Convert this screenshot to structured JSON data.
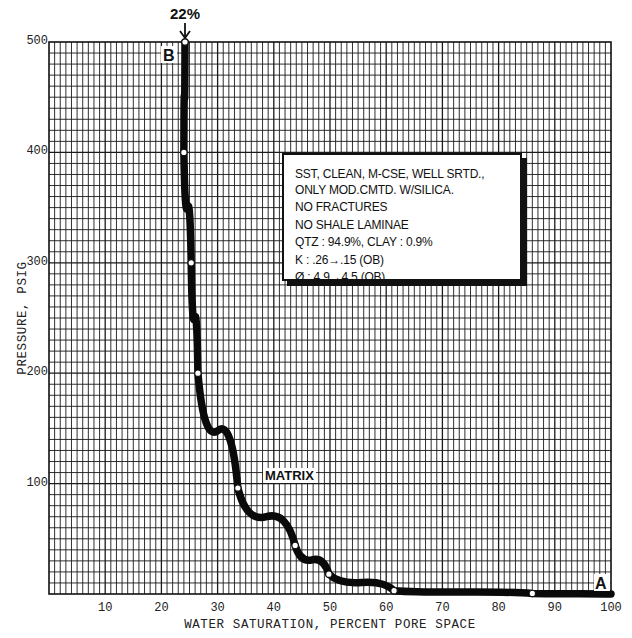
{
  "chart_data": {
    "type": "line",
    "title": "",
    "xlabel": "WATER SATURATION, PERCENT PORE SPACE",
    "ylabel": "PRESSURE, PSIG",
    "xlim": [
      0,
      100
    ],
    "ylim": [
      0,
      500
    ],
    "x_ticks": [
      10,
      20,
      30,
      40,
      50,
      60,
      70,
      80,
      90,
      100
    ],
    "y_ticks": [
      100,
      200,
      300,
      400,
      500
    ],
    "grid": true,
    "series": [
      {
        "name": "MATRIX",
        "x": [
          24.2,
          24.0,
          25.3,
          26.5,
          33.6,
          43.8,
          49.8,
          61.4,
          86.0,
          100
        ],
        "y": [
          500,
          400,
          300,
          200,
          96,
          44,
          18,
          3,
          0.5,
          0
        ]
      }
    ],
    "annotations": [
      {
        "text": "22%",
        "x": 24.2,
        "y": 500,
        "type": "arrow"
      },
      {
        "text": "B",
        "x": 21.5,
        "y": 490
      },
      {
        "text": "A",
        "x": 98,
        "y": 8
      },
      {
        "text": "MATRIX",
        "x": 40,
        "y": 100
      }
    ],
    "legend_box": [
      "SST, CLEAN, M-CSE, WELL SRTD.,",
      "ONLY MOD.CMTD. W/SILICA.",
      "NO FRACTURES",
      "NO SHALE LAMINAE",
      "QTZ : 94.9%, CLAY : 0.9%",
      "K : .26→.15 (OB)",
      "Ø : 4.9→4.5 (OB)"
    ]
  },
  "labels": {
    "top_arrow": "22%",
    "point_b": "B",
    "point_a": "A",
    "curve": "MATRIX",
    "caption": "FIGURE 5-10..."
  },
  "info_box": {
    "line1": "SST, CLEAN, M-CSE, WELL SRTD.,",
    "line2": "ONLY MOD.CMTD. W/SILICA.",
    "line3": "NO FRACTURES",
    "line4": "NO SHALE LAMINAE",
    "line5": "QTZ : 94.9%, CLAY : 0.9%",
    "line6": "K : .26→.15 (OB)",
    "line7": "Ø : 4.9→4.5 (OB)"
  },
  "colors": {
    "ink": "#111111",
    "grid": "#1a1a1a",
    "paper": "#ffffff"
  }
}
